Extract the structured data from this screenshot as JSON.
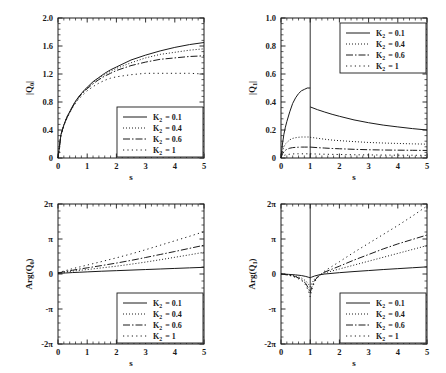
{
  "figure": {
    "background": "#ffffff",
    "ink": "#1a1a1a",
    "panel_count": 4
  },
  "series_styles": {
    "solid": "none",
    "dotted": "1,2",
    "dashdot": "7,2,1.5,2",
    "loose": "1.2,3.2"
  },
  "legend": {
    "entries": [
      {
        "symbol": "K",
        "subscript": "2",
        "equals": "= 0.1",
        "value": 0.1,
        "style": "solid"
      },
      {
        "symbol": "K",
        "subscript": "2",
        "equals": "= 0.4",
        "value": 0.4,
        "style": "dotted"
      },
      {
        "symbol": "K",
        "subscript": "2",
        "equals": "= 0.6",
        "value": 0.6,
        "style": "dashdot"
      },
      {
        "symbol": "K",
        "subscript": "2",
        "equals": "= 1",
        "value": 1.0,
        "style": "loose"
      }
    ]
  },
  "chart_data": [
    {
      "id": "q0-magnitude",
      "type": "line",
      "title": "",
      "xlabel": "s",
      "ylabel": "|Q_0|",
      "ylabel_parts": {
        "pre": "|Q",
        "sub": "0",
        "post": "|"
      },
      "xlim": [
        0,
        5
      ],
      "ylim": [
        0,
        2.0
      ],
      "xticks": [
        0,
        1,
        2,
        3,
        4,
        5
      ],
      "xticklabels": [
        "0",
        "1",
        "2",
        "3",
        "4",
        "5"
      ],
      "yticks": [
        0,
        0.4,
        0.8,
        1.2,
        1.6,
        2.0
      ],
      "yticklabels": [
        "0",
        "0.4",
        "0.8",
        "1.2",
        "1.6",
        "2.0"
      ],
      "grid": false,
      "legend_position": "lower-right",
      "x": [
        0,
        0.1,
        0.2,
        0.3,
        0.4,
        0.5,
        0.6,
        0.7,
        0.8,
        0.9,
        1.0,
        1.2,
        1.4,
        1.6,
        1.8,
        2.0,
        2.5,
        3.0,
        3.5,
        4.0,
        4.5,
        5.0
      ],
      "series": [
        {
          "name": "K_2 = 0.1",
          "style": "solid",
          "values": [
            0,
            0.33,
            0.47,
            0.58,
            0.66,
            0.74,
            0.81,
            0.87,
            0.92,
            0.97,
            1.01,
            1.09,
            1.15,
            1.21,
            1.26,
            1.3,
            1.4,
            1.47,
            1.53,
            1.58,
            1.62,
            1.65
          ]
        },
        {
          "name": "K_2 = 0.4",
          "style": "dotted",
          "values": [
            0,
            0.33,
            0.47,
            0.58,
            0.66,
            0.74,
            0.81,
            0.87,
            0.92,
            0.96,
            1.0,
            1.08,
            1.14,
            1.19,
            1.24,
            1.28,
            1.36,
            1.43,
            1.48,
            1.51,
            1.54,
            1.56
          ]
        },
        {
          "name": "K_2 = 0.6",
          "style": "dashdot",
          "values": [
            0,
            0.33,
            0.47,
            0.57,
            0.65,
            0.73,
            0.8,
            0.86,
            0.91,
            0.95,
            0.99,
            1.06,
            1.12,
            1.17,
            1.21,
            1.25,
            1.32,
            1.37,
            1.41,
            1.43,
            1.45,
            1.46
          ]
        },
        {
          "name": "K_2 = 1",
          "style": "loose",
          "values": [
            0,
            0.33,
            0.46,
            0.56,
            0.64,
            0.72,
            0.78,
            0.84,
            0.88,
            0.92,
            0.96,
            1.02,
            1.07,
            1.11,
            1.14,
            1.16,
            1.19,
            1.21,
            1.21,
            1.21,
            1.21,
            1.2
          ]
        }
      ]
    },
    {
      "id": "q1-magnitude",
      "type": "line",
      "title": "",
      "xlabel": "s",
      "ylabel": "|Q_1|",
      "ylabel_parts": {
        "pre": "|Q",
        "sub": "1",
        "post": "|"
      },
      "xlim": [
        0,
        5
      ],
      "ylim": [
        0,
        1.0
      ],
      "xticks": [
        0,
        1,
        2,
        3,
        4,
        5
      ],
      "xticklabels": [
        "0",
        "1",
        "2",
        "3",
        "4",
        "5"
      ],
      "yticks": [
        0,
        0.2,
        0.4,
        0.6,
        0.8,
        1.0
      ],
      "yticklabels": [
        "0",
        "0.2",
        "0.4",
        "0.6",
        "0.8",
        "1.0"
      ],
      "grid": false,
      "legend_position": "upper-right",
      "vertical_line_at": 1.0,
      "x_left": [
        0,
        0.05,
        0.1,
        0.15,
        0.2,
        0.3,
        0.4,
        0.5,
        0.6,
        0.7,
        0.8,
        0.9,
        1.0
      ],
      "x_right": [
        1.0,
        1.25,
        1.5,
        1.75,
        2.0,
        2.5,
        3.0,
        3.5,
        4.0,
        4.5,
        5.0
      ],
      "series": [
        {
          "name": "K_2 = 0.1",
          "style": "solid",
          "left": [
            0,
            0.1,
            0.17,
            0.22,
            0.26,
            0.33,
            0.39,
            0.43,
            0.46,
            0.48,
            0.49,
            0.5,
            0.5
          ],
          "right": [
            0.365,
            0.345,
            0.328,
            0.312,
            0.298,
            0.272,
            0.252,
            0.235,
            0.222,
            0.21,
            0.2
          ]
        },
        {
          "name": "K_2 = 0.4",
          "style": "dotted",
          "left": [
            0,
            0.05,
            0.08,
            0.1,
            0.11,
            0.13,
            0.14,
            0.145,
            0.148,
            0.15,
            0.15,
            0.15,
            0.15
          ],
          "right": [
            0.148,
            0.141,
            0.134,
            0.128,
            0.124,
            0.117,
            0.111,
            0.107,
            0.104,
            0.101,
            0.099
          ]
        },
        {
          "name": "K_2 = 0.6",
          "style": "dashdot",
          "left": [
            0,
            0.03,
            0.045,
            0.055,
            0.062,
            0.07,
            0.074,
            0.076,
            0.077,
            0.078,
            0.078,
            0.078,
            0.078
          ],
          "right": [
            0.078,
            0.074,
            0.071,
            0.068,
            0.066,
            0.062,
            0.059,
            0.057,
            0.056,
            0.055,
            0.054
          ]
        },
        {
          "name": "K_2 = 1",
          "style": "loose",
          "left": [
            0,
            0.012,
            0.018,
            0.022,
            0.024,
            0.027,
            0.029,
            0.03,
            0.03,
            0.03,
            0.03,
            0.03,
            0.03
          ],
          "right": [
            0.03,
            0.028,
            0.027,
            0.026,
            0.025,
            0.023,
            0.022,
            0.021,
            0.02,
            0.02,
            0.019
          ]
        }
      ]
    },
    {
      "id": "q0-phase",
      "type": "line",
      "title": "",
      "xlabel": "s",
      "ylabel": "Arg(Q_0)",
      "ylabel_parts": {
        "pre": "Arg(Q",
        "sub": "0",
        "post": ")"
      },
      "xlim": [
        0,
        5
      ],
      "ylim": [
        -6.2832,
        6.2832
      ],
      "xticks": [
        0,
        1,
        2,
        3,
        4,
        5
      ],
      "xticklabels": [
        "0",
        "1",
        "2",
        "3",
        "4",
        "5"
      ],
      "yticks": [
        -6.2832,
        -3.1416,
        0,
        3.1416,
        6.2832
      ],
      "yticklabels": [
        "-2π",
        "-π",
        "0",
        "π",
        "2π"
      ],
      "grid": false,
      "legend_position": "lower-right",
      "x": [
        0,
        0.25,
        0.5,
        0.75,
        1.0,
        1.5,
        2.0,
        2.5,
        3.0,
        3.5,
        4.0,
        4.5,
        5.0
      ],
      "series": [
        {
          "name": "K_2 = 0.1",
          "style": "solid",
          "values": [
            0.05,
            0.09,
            0.13,
            0.16,
            0.19,
            0.25,
            0.3,
            0.35,
            0.4,
            0.45,
            0.5,
            0.55,
            0.6
          ]
        },
        {
          "name": "K_2 = 0.4",
          "style": "dotted",
          "values": [
            0.08,
            0.17,
            0.26,
            0.33,
            0.4,
            0.55,
            0.7,
            0.88,
            1.07,
            1.28,
            1.5,
            1.72,
            1.95
          ]
        },
        {
          "name": "K_2 = 0.6",
          "style": "dashdot",
          "values": [
            0.1,
            0.22,
            0.34,
            0.45,
            0.55,
            0.76,
            0.98,
            1.22,
            1.48,
            1.75,
            2.02,
            2.3,
            2.58
          ]
        },
        {
          "name": "K_2 = 1",
          "style": "loose",
          "values": [
            0.12,
            0.3,
            0.48,
            0.64,
            0.8,
            1.12,
            1.45,
            1.8,
            2.18,
            2.58,
            2.98,
            3.38,
            3.8
          ]
        }
      ]
    },
    {
      "id": "q1-phase",
      "type": "line",
      "title": "",
      "xlabel": "s",
      "ylabel": "Arg(Q_1)",
      "ylabel_parts": {
        "pre": "Arg(Q",
        "sub": "1",
        "post": ")"
      },
      "xlim": [
        0,
        5
      ],
      "ylim": [
        -6.2832,
        6.2832
      ],
      "xticks": [
        0,
        1,
        2,
        3,
        4,
        5
      ],
      "xticklabels": [
        "0",
        "1",
        "2",
        "3",
        "4",
        "5"
      ],
      "yticks": [
        -6.2832,
        -3.1416,
        0,
        3.1416,
        6.2832
      ],
      "yticklabels": [
        "-2π",
        "-π",
        "0",
        "π",
        "2π"
      ],
      "grid": false,
      "legend_position": "lower-right",
      "vertical_line_at": 1.0,
      "x": [
        0,
        0.25,
        0.5,
        0.7,
        0.85,
        0.95,
        1.0,
        1.05,
        1.15,
        1.3,
        1.5,
        2.0,
        2.5,
        3.0,
        3.5,
        4.0,
        4.5,
        5.0
      ],
      "series": [
        {
          "name": "K_2 = 0.1",
          "style": "solid",
          "values": [
            0,
            -0.03,
            -0.08,
            -0.14,
            -0.22,
            -0.3,
            -0.34,
            -0.28,
            -0.18,
            -0.08,
            0.0,
            0.12,
            0.22,
            0.31,
            0.4,
            0.48,
            0.56,
            0.64
          ]
        },
        {
          "name": "K_2 = 0.4",
          "style": "dotted",
          "values": [
            0,
            -0.06,
            -0.18,
            -0.36,
            -0.62,
            -0.95,
            -1.15,
            -0.85,
            -0.45,
            -0.12,
            0.1,
            0.45,
            0.8,
            1.15,
            1.5,
            1.85,
            2.2,
            2.55
          ]
        },
        {
          "name": "K_2 = 0.6",
          "style": "dashdot",
          "values": [
            0,
            -0.08,
            -0.24,
            -0.48,
            -0.85,
            -1.35,
            -1.7,
            -1.2,
            -0.58,
            -0.15,
            0.18,
            0.7,
            1.25,
            1.75,
            2.25,
            2.7,
            3.1,
            3.5
          ]
        },
        {
          "name": "K_2 = 1",
          "style": "loose",
          "values": [
            0,
            -0.1,
            -0.3,
            -0.58,
            -1.0,
            -1.6,
            -2.05,
            -1.45,
            -0.7,
            -0.18,
            0.28,
            1.1,
            1.95,
            2.75,
            3.55,
            4.35,
            5.2,
            6.1
          ]
        }
      ]
    }
  ]
}
